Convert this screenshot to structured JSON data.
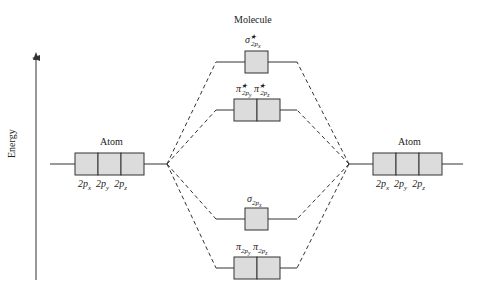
{
  "title": "Molecule",
  "axis_label": "Energy",
  "left_atom": {
    "label": "Atom",
    "orbitals": [
      "2p_x",
      "2p_y",
      "2p_z"
    ]
  },
  "right_atom": {
    "label": "Atom",
    "orbitals": [
      "2p_x",
      "2p_y",
      "2p_z"
    ]
  },
  "molecular_orbitals": [
    {
      "name": "sigma*_2px",
      "symbol": "σ",
      "star": "★",
      "sub": "2p",
      "subsub": "x",
      "boxes": 1
    },
    {
      "name": "pi*_2py pi*_2pz",
      "labels": [
        {
          "symbol": "π",
          "star": "★",
          "sub": "2p",
          "subsub": "y"
        },
        {
          "symbol": "π",
          "star": "★",
          "sub": "2p",
          "subsub": "z"
        }
      ],
      "boxes": 2
    },
    {
      "name": "sigma_2px",
      "symbol": "σ",
      "sub": "2p",
      "subsub": "x",
      "boxes": 1
    },
    {
      "name": "pi_2py pi_2pz",
      "labels": [
        {
          "symbol": "π",
          "sub": "2p",
          "subsub": "y"
        },
        {
          "symbol": "π",
          "sub": "2p",
          "subsub": "z"
        }
      ],
      "boxes": 2
    }
  ],
  "colors": {
    "box_fill": "#dcdcdc",
    "line": "#333333"
  }
}
